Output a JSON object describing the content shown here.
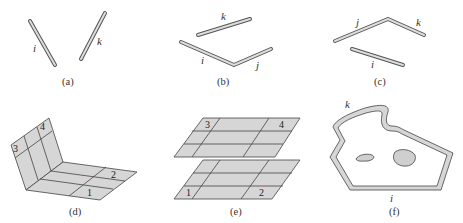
{
  "figure": {
    "panels": [
      {
        "id": "a",
        "caption": "(a)",
        "edge_labels": [
          "i",
          "k"
        ]
      },
      {
        "id": "b",
        "caption": "(b)",
        "edge_labels": [
          "k",
          "i",
          "j"
        ]
      },
      {
        "id": "c",
        "caption": "(c)",
        "edge_labels": [
          "j",
          "k",
          "i"
        ]
      },
      {
        "id": "d",
        "caption": "(d)",
        "face_labels": [
          "1",
          "2",
          "3",
          "4"
        ]
      },
      {
        "id": "e",
        "caption": "(e)",
        "face_labels": [
          "1",
          "2",
          "3",
          "4"
        ]
      },
      {
        "id": "f",
        "caption": "(f)",
        "edge_labels": [
          "k",
          "i"
        ]
      }
    ],
    "colors": {
      "fill": "#d6d6d6",
      "stroke": "#444444",
      "background": "#ffffff"
    }
  }
}
